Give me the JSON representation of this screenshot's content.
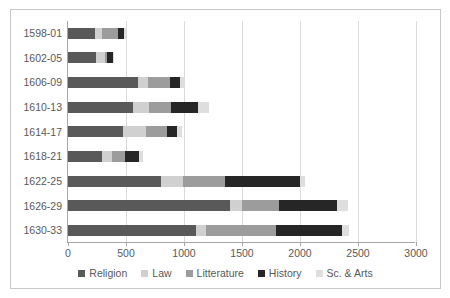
{
  "chart_data": {
    "type": "bar",
    "orientation": "horizontal",
    "stacked": true,
    "title": "",
    "xlabel": "",
    "ylabel": "",
    "xlim": [
      0,
      3000
    ],
    "xticks": [
      0,
      500,
      1000,
      1500,
      2000,
      2500,
      3000
    ],
    "grid": "vertical",
    "legend_position": "bottom",
    "categories": [
      "1598-01",
      "1602-05",
      "1606-09",
      "1610-13",
      "1614-17",
      "1618-21",
      "1622-25",
      "1626-29",
      "1630-33"
    ],
    "series": [
      {
        "name": "Religion",
        "color": "#595959",
        "values": [
          230,
          240,
          600,
          560,
          470,
          290,
          800,
          1400,
          1100
        ]
      },
      {
        "name": "Law",
        "color": "#d0d0d0",
        "values": [
          60,
          80,
          90,
          140,
          200,
          90,
          190,
          100,
          90
        ]
      },
      {
        "name": "Litterature",
        "color": "#9c9c9c",
        "values": [
          140,
          20,
          190,
          190,
          180,
          110,
          360,
          320,
          600
        ]
      },
      {
        "name": "History",
        "color": "#262626",
        "values": [
          55,
          50,
          85,
          230,
          90,
          120,
          650,
          500,
          570
        ]
      },
      {
        "name": "Sc. & Arts",
        "color": "#dedede",
        "values": [
          15,
          10,
          45,
          100,
          40,
          40,
          40,
          90,
          60
        ]
      }
    ],
    "totals": [
      500,
      400,
      1010,
      1220,
      980,
      650,
      2040,
      2410,
      2420
    ]
  },
  "colors": {
    "plot_background": "#ffffff",
    "frame_border": "#c8c8c8",
    "axis_line": "#a6a6a6",
    "gridline": "#d9d9d9",
    "tick_text": "#595959"
  }
}
